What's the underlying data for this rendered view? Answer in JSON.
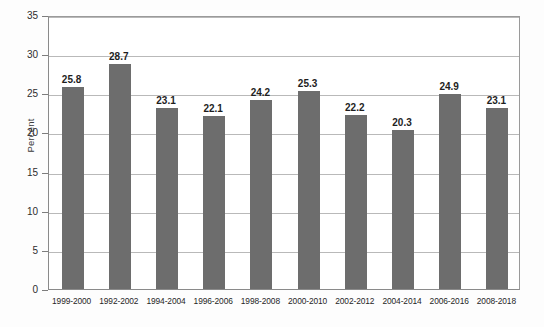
{
  "chart_data": {
    "type": "bar",
    "title": "",
    "subtitle": "",
    "xlabel": "",
    "ylabel": "Percent",
    "ylim": [
      0,
      35
    ],
    "ytick_step": 5,
    "yticks": [
      0,
      5,
      10,
      15,
      20,
      25,
      30,
      35
    ],
    "grid": true,
    "legend": null,
    "bar_color": "#6d6d6d",
    "categories": [
      "1999-2000",
      "1992-2002",
      "1994-2004",
      "1996-2006",
      "1998-2008",
      "2000-2010",
      "2002-2012",
      "2004-2014",
      "2006-2016",
      "2008-2018"
    ],
    "values": [
      25.8,
      28.7,
      23.1,
      22.1,
      24.2,
      25.3,
      22.2,
      20.3,
      24.9,
      23.1
    ],
    "value_labels": [
      "25.8",
      "28.7",
      "23.1",
      "22.1",
      "24.2",
      "25.3",
      "22.2",
      "20.3",
      "24.9",
      "23.1"
    ],
    "ytick_labels": [
      "0",
      "5",
      "10",
      "15",
      "20",
      "25",
      "30",
      "35"
    ]
  }
}
